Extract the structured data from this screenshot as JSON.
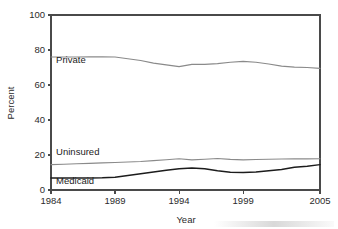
{
  "chart_data": {
    "type": "line",
    "title": "",
    "xlabel": "Year",
    "ylabel": "Percent",
    "xlim": [
      1984,
      2005
    ],
    "ylim": [
      0,
      100
    ],
    "xticks": [
      1984,
      1989,
      1994,
      1999,
      2005
    ],
    "yticks": [
      0,
      20,
      40,
      60,
      80,
      100
    ],
    "grid": false,
    "legend_position": "inline-labels",
    "x": [
      1984,
      1985,
      1986,
      1987,
      1988,
      1989,
      1990,
      1991,
      1992,
      1993,
      1994,
      1995,
      1996,
      1997,
      1998,
      1999,
      2000,
      2001,
      2002,
      2003,
      2004,
      2005
    ],
    "series": [
      {
        "name": "Private",
        "color": "#8a8a8a",
        "values": [
          76.0,
          76.0,
          76.0,
          76.1,
          76.1,
          76.0,
          75.0,
          74.0,
          72.5,
          71.5,
          70.5,
          71.8,
          71.8,
          72.2,
          73.0,
          73.5,
          73.0,
          72.0,
          70.8,
          70.2,
          70.0,
          69.5
        ]
      },
      {
        "name": "Uninsured",
        "color": "#8a8a8a",
        "values": [
          14.5,
          14.7,
          15.0,
          15.2,
          15.5,
          15.7,
          16.0,
          16.3,
          16.8,
          17.3,
          17.9,
          17.2,
          17.6,
          18.0,
          17.5,
          17.2,
          17.4,
          17.6,
          17.7,
          17.8,
          17.8,
          17.9
        ]
      },
      {
        "name": "Medicaid",
        "color": "#1c1c1c",
        "values": [
          6.9,
          6.9,
          6.9,
          6.9,
          7.0,
          7.3,
          8.3,
          9.3,
          10.3,
          11.3,
          12.2,
          12.6,
          12.2,
          11.0,
          10.2,
          10.0,
          10.3,
          11.0,
          11.7,
          13.0,
          13.6,
          14.5
        ]
      }
    ],
    "annotations": [
      {
        "text": "Private",
        "x": 1984.4,
        "y": 72.5
      },
      {
        "text": "Uninsured",
        "x": 1984.4,
        "y": 19.8
      },
      {
        "text": "Medicaid",
        "x": 1984.4,
        "y": 3.6
      }
    ]
  }
}
